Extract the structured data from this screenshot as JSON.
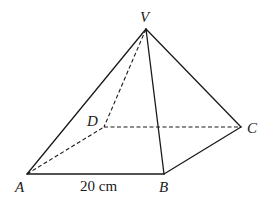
{
  "diagram": {
    "type": "square-based pyramid",
    "vertices": {
      "V": {
        "label": "V",
        "x": 146,
        "y": 29
      },
      "A": {
        "label": "A",
        "x": 27,
        "y": 174
      },
      "B": {
        "label": "B",
        "x": 164,
        "y": 174
      },
      "C": {
        "label": "C",
        "x": 241,
        "y": 127
      },
      "D": {
        "label": "D",
        "x": 104,
        "y": 127
      }
    },
    "edges": {
      "visible": [
        "VA",
        "VB",
        "VC",
        "AB",
        "BC"
      ],
      "hidden": [
        "VD",
        "AD",
        "DC"
      ]
    },
    "dimensions": {
      "AB": "20 cm"
    },
    "colors": {
      "line": "#1a1a1a",
      "background": "#ffffff"
    }
  }
}
